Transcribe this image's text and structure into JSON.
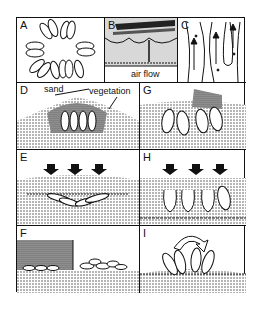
{
  "figure": {
    "panels": [
      {
        "id": "A",
        "label": "A",
        "content": "ring of elongated seed/egg shapes viewed from above"
      },
      {
        "id": "B",
        "label": "B",
        "content": "cross section with layered surface",
        "annotation": "air flow"
      },
      {
        "id": "C",
        "label": "C",
        "content": "flow lines with upward arrows"
      },
      {
        "id": "D",
        "label": "D",
        "annotations": [
          "sand",
          "vegetation"
        ],
        "content": "mound of sand over upright oval shapes"
      },
      {
        "id": "E",
        "label": "E",
        "content": "downward arrows compressing buried flattened shapes"
      },
      {
        "id": "F",
        "label": "F",
        "content": "stepped sediment block with flattened debris"
      },
      {
        "id": "G",
        "label": "G",
        "content": "oval shapes buried within speckled sediment"
      },
      {
        "id": "H",
        "label": "H",
        "content": "downward arrows over partially collapsed oval shapes"
      },
      {
        "id": "I",
        "label": "I",
        "content": "curved rotation arrow over fanned oval shapes on sand surface"
      }
    ],
    "colors": {
      "ink": "#111111",
      "sediment": "#9a9a9a",
      "paper": "#ffffff"
    }
  }
}
